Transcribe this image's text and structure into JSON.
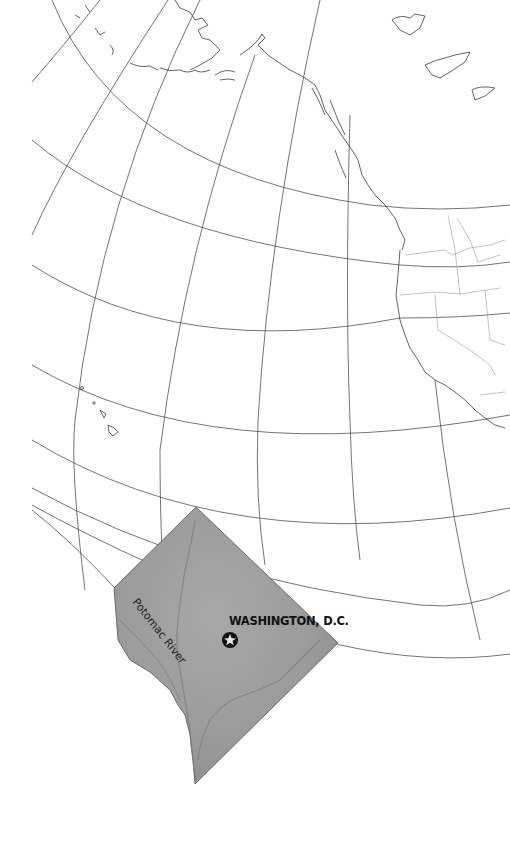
{
  "map": {
    "title": "Washington, D.C. locator map",
    "labels": {
      "city": "WASHINGTON, D.C.",
      "river": "Potomac River"
    },
    "markers": [
      {
        "name": "capital-star",
        "label": "WASHINGTON, D.C.",
        "x": 230,
        "y": 640
      }
    ],
    "regions_shown": [
      "Alaska",
      "Aleutian Islands",
      "British Columbia coast",
      "Pacific Northwest",
      "California",
      "Hawaii islands",
      "District of Columbia inset"
    ],
    "colors": {
      "background": "#ffffff",
      "graticule": "#3a3a3a",
      "coastline": "#222222",
      "state_borders": "#9a9a9a",
      "dc_fill": "#9c9c9c",
      "marker": "#111111"
    }
  }
}
